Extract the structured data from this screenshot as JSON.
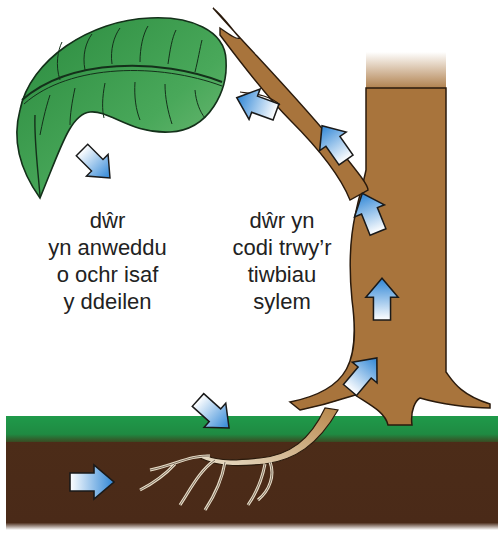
{
  "diagram": {
    "type": "transpiration-stream",
    "language": "Welsh",
    "labels": {
      "leaf_evaporation": {
        "lines": [
          "dŵr",
          "yn anweddu",
          "o ochr isaf",
          "y ddeilen"
        ]
      },
      "xylem_rise": {
        "lines": [
          "dŵr yn",
          "codi trwy’r",
          "tiwbiau",
          "sylem"
        ]
      }
    },
    "elements": [
      "leaf",
      "branch",
      "trunk",
      "grass",
      "soil",
      "roots",
      "arrows"
    ],
    "arrows": [
      {
        "id": "arrow-soil-to-roots",
        "direction": "right"
      },
      {
        "id": "arrow-into-ground",
        "direction": "down-right"
      },
      {
        "id": "arrow-trunk-base",
        "direction": "up-right"
      },
      {
        "id": "arrow-trunk-middle",
        "direction": "up"
      },
      {
        "id": "arrow-trunk-upper",
        "direction": "up-left"
      },
      {
        "id": "arrow-branch-upper",
        "direction": "up-left"
      },
      {
        "id": "arrow-branch-to-leaf",
        "direction": "left"
      },
      {
        "id": "arrow-leaf-out",
        "direction": "down-right"
      }
    ],
    "colors": {
      "leaf": "#3c9a4e",
      "leaf_dark": "#1f7a35",
      "bark": "#a8743c",
      "soil": "#4a2a18",
      "grass": "#1f8c45",
      "arrow_blue": "#3a8fd8",
      "root": "#e8ddc8"
    }
  }
}
